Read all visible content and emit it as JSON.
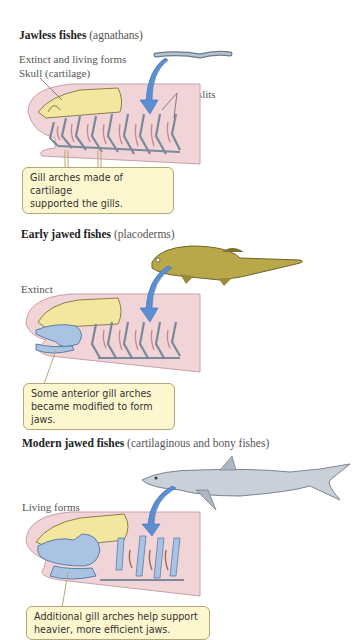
{
  "sections": [
    {
      "id": "jawless",
      "title_bold": "Jawless fishes",
      "title_paren": "(agnathans)",
      "status": "Extinct and living forms",
      "labels": {
        "skull": "Skull (cartilage)",
        "gill_slits": "Gill slits"
      },
      "callout_line1": "Gill arches made of cartilage",
      "callout_line2": "supported the gills."
    },
    {
      "id": "placoderms",
      "title_bold": "Early jawed fishes",
      "title_paren": "(placoderms)",
      "status": "Extinct",
      "callout_line1": "Some anterior gill arches",
      "callout_line2": "became modified to form jaws."
    },
    {
      "id": "modern",
      "title_bold": "Modern jawed fishes",
      "title_paren": "(cartilaginous and bony fishes)",
      "status": "Living forms",
      "callout_line1": "Additional gill arches help support",
      "callout_line2": "heavier, more efficient jaws."
    }
  ],
  "colors": {
    "body_pink": "#f0d4d8",
    "skull_yellow": "#f3e7a0",
    "arch_gray": "#8a96a8",
    "jaw_blue": "#a9c4e2",
    "arrow_blue": "#5b8fd1",
    "callout_bg": "#fdf7cf",
    "placoderm": "#b9a84a",
    "shark": "#c9d0d8"
  }
}
